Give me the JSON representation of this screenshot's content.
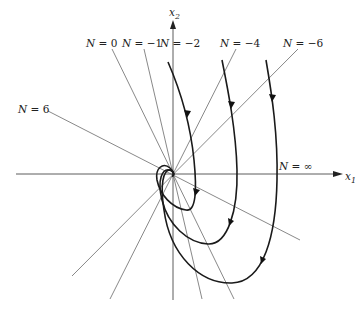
{
  "diagram": {
    "type": "phase-plane isocline diagram",
    "axes": {
      "x_label": "x",
      "x_sub": "1",
      "y_label": "x",
      "y_sub": "2"
    },
    "isoclines": [
      {
        "id": "n0",
        "label_n": "N",
        "label_eq": " = 0",
        "x1": 112,
        "y1": 52,
        "x2": 173,
        "y2": 174
      },
      {
        "id": "nm1",
        "label_n": "N",
        "label_eq": " = −1",
        "x1": 144,
        "y1": 52,
        "x2": 173,
        "y2": 174
      },
      {
        "id": "nm2",
        "label_n": "N",
        "label_eq": " = −2",
        "x1": 173,
        "y1": 52,
        "x2": 173,
        "y2": 174
      },
      {
        "id": "nm4",
        "label_n": "N",
        "label_eq": " = −4",
        "x1": 236,
        "y1": 50,
        "x2": 173,
        "y2": 174
      },
      {
        "id": "nm6",
        "label_n": "N",
        "label_eq": " = −6",
        "x1": 298,
        "y1": 50,
        "x2": 173,
        "y2": 174
      },
      {
        "id": "n6",
        "label_n": "N",
        "label_eq": " = 6",
        "x1": 48,
        "y1": 110,
        "x2": 173,
        "y2": 174
      },
      {
        "id": "ninf",
        "label_n": "N",
        "label_eq": " = ∞"
      }
    ],
    "labels": {
      "n0": "N = 0",
      "nm1": "N = −1",
      "nm2": "N = −2",
      "nm4": "N = −4",
      "nm6": "N = −6",
      "n6": "N = 6",
      "ninf": "N =  ∞"
    },
    "colors": {
      "trajectory": "#1a1a1a",
      "isocline": "#555555",
      "axis": "#333333",
      "background": "#ffffff"
    }
  }
}
